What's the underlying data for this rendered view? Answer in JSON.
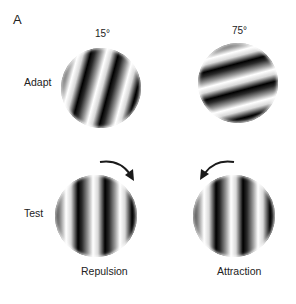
{
  "figure": {
    "panel_letter": "A",
    "columns": [
      {
        "angle_label": "15°",
        "adapt_orientation_deg": 15,
        "condition_label": "Repulsion",
        "arrow_direction": "clockwise"
      },
      {
        "angle_label": "75°",
        "adapt_orientation_deg": 75,
        "condition_label": "Attraction",
        "arrow_direction": "counterclockwise"
      }
    ],
    "rows": [
      {
        "label": "Adapt"
      },
      {
        "label": "Test",
        "test_orientation_deg": 0
      }
    ],
    "colors": {
      "background": "#ffffff",
      "text": "#222222",
      "grating_dark": "#000000",
      "grating_light": "#ffffff",
      "arrow": "#1a1a1a"
    }
  }
}
